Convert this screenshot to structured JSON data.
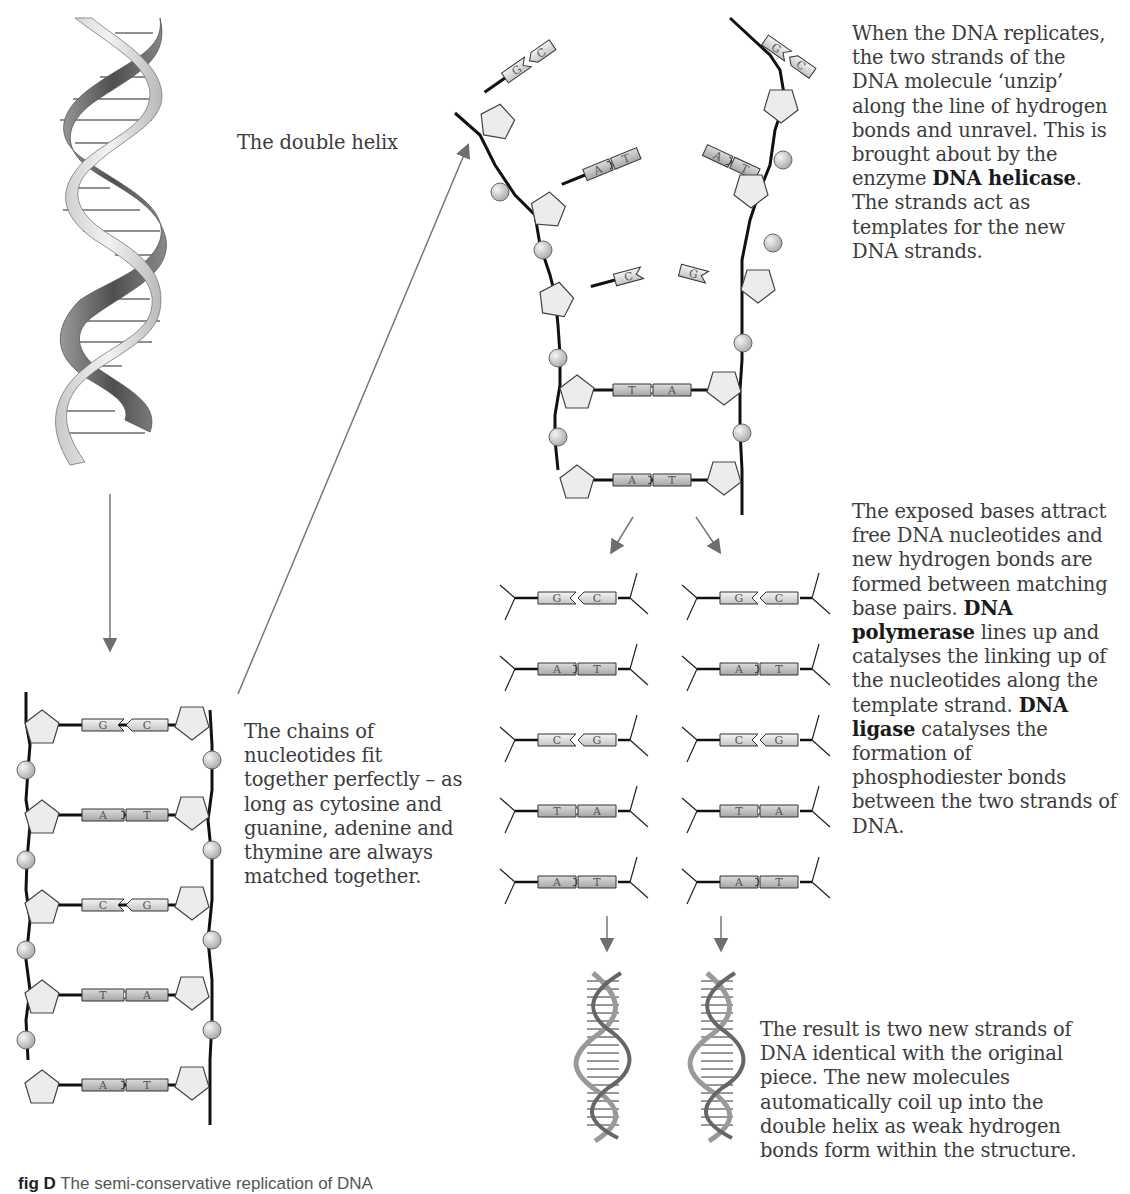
{
  "labels": {
    "double_helix": "The double helix",
    "unzip": {
      "before": "When the DNA replicates, the two strands of the DNA molecule ‘unzip’ along the line of hydrogen bonds and unravel. This is brought about by the enzyme ",
      "bold": "DNA helicase",
      "after": ". The strands act as templates for the new DNA strands."
    },
    "chains": "The chains of nucleotides fit together perfectly – as long as cytosine and guanine, adenine and thymine are always matched together.",
    "exposed": {
      "p1": "The exposed bases attract free DNA nucleotides and new hydrogen bonds are formed between matching base pairs. ",
      "b1": "DNA polymerase",
      "p2": " lines up and catalyses the linking up of the nucleotides along the template strand. ",
      "b2": "DNA ligase",
      "p3": " catalyses the formation of phosphodiester bonds between the two strands of DNA."
    },
    "result": "The result is two new strands of DNA identical with the original piece. The new molecules automatically coil up into the double helix as weak hydrogen bonds form within the structure."
  },
  "caption": {
    "fig": "fig D",
    "text": "The semi-conservative replication of DNA"
  },
  "ladder_pairs": [
    [
      "G",
      "C"
    ],
    [
      "A",
      "T"
    ],
    [
      "C",
      "G"
    ],
    [
      "T",
      "A"
    ],
    [
      "A",
      "T"
    ]
  ],
  "unzipped": {
    "left_bases": [
      "G",
      "A",
      "C"
    ],
    "right_bases": [
      "C",
      "T",
      "G"
    ],
    "lower_pairs": [
      [
        "T",
        "A"
      ],
      [
        "A",
        "T"
      ]
    ]
  },
  "new_strands": {
    "left": [
      [
        "G",
        "C"
      ],
      [
        "A",
        "T"
      ],
      [
        "C",
        "G"
      ],
      [
        "T",
        "A"
      ],
      [
        "A",
        "T"
      ]
    ],
    "right": [
      [
        "G",
        "C"
      ],
      [
        "A",
        "T"
      ],
      [
        "C",
        "G"
      ],
      [
        "T",
        "A"
      ],
      [
        "A",
        "T"
      ]
    ]
  },
  "colors": {
    "backbone": "#1a1a1a",
    "sugar_fill": "#ececec",
    "phosphate_fill": "#dcdcdc",
    "arrow": "#777777",
    "helix_dark": "#6a6a6a",
    "helix_light": "#d6d6d6"
  }
}
